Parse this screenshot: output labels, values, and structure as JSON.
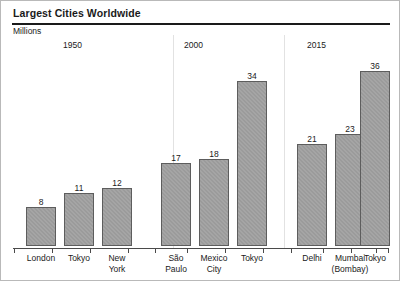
{
  "title": "Largest Cities Worldwide",
  "units_label": "Millions",
  "colors": {
    "bar_fill": "#9b9b9b",
    "bar_outline": "#5d5d5d",
    "axis": "#4a4a4a",
    "rule": "#1a1a1a",
    "separator": "#e2e2e2",
    "text": "#1a1a1a"
  },
  "groups": [
    {
      "year": "1950"
    },
    {
      "year": "2000"
    },
    {
      "year": "2015"
    }
  ],
  "chart_data": {
    "type": "bar",
    "title": "Largest Cities Worldwide",
    "subtitle": "",
    "xlabel": "",
    "ylabel": "Millions",
    "ylim": [
      0,
      38
    ],
    "grid": false,
    "legend": null,
    "value_labels": true,
    "group_labels": [
      "1950",
      "2000",
      "2015"
    ],
    "categories": [
      "London",
      "Tokyo",
      "New York",
      "São Paulo",
      "Mexico City",
      "Tokyo",
      "Delhi",
      "Mumbai (Bombay)",
      "Tokyo"
    ],
    "values": [
      8,
      11,
      12,
      17,
      18,
      34,
      21,
      23,
      36
    ],
    "bars": [
      {
        "group": "1950",
        "label": "London",
        "label_lines": [
          "London"
        ],
        "value": 8
      },
      {
        "group": "1950",
        "label": "Tokyo",
        "label_lines": [
          "Tokyo"
        ],
        "value": 11
      },
      {
        "group": "1950",
        "label": "New York",
        "label_lines": [
          "New",
          "York"
        ],
        "value": 12
      },
      {
        "group": "2000",
        "label": "São Paulo",
        "label_lines": [
          "São",
          "Paulo"
        ],
        "value": 17
      },
      {
        "group": "2000",
        "label": "Mexico City",
        "label_lines": [
          "Mexico",
          "City"
        ],
        "value": 18
      },
      {
        "group": "2000",
        "label": "Tokyo",
        "label_lines": [
          "Tokyo"
        ],
        "value": 34
      },
      {
        "group": "2015",
        "label": "Delhi",
        "label_lines": [
          "Delhi"
        ],
        "value": 21
      },
      {
        "group": "2015",
        "label": "Mumbai (Bombay)",
        "label_lines": [
          "Mumbai",
          "(Bombay)"
        ],
        "value": 23
      },
      {
        "group": "2015",
        "label": "Tokyo",
        "label_lines": [
          "Tokyo"
        ],
        "value": 36
      }
    ]
  },
  "layout": {
    "bar_left": [
      25,
      63,
      101,
      160,
      198,
      236,
      296,
      334,
      359
    ],
    "bar_width": 30,
    "separator_x": [
      172,
      283
    ],
    "year_x": [
      62,
      183,
      306
    ],
    "tick_x": [
      13,
      51,
      89,
      127,
      154,
      186,
      224,
      262,
      290,
      322,
      350,
      375,
      387
    ],
    "baseline_y": 247,
    "px_per_unit": 4.86
  }
}
